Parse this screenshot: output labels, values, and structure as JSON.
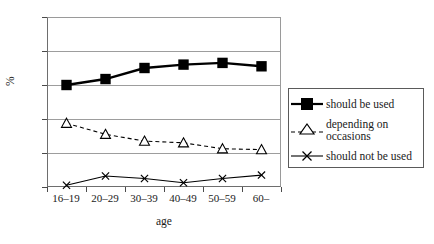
{
  "chart_data": {
    "type": "line",
    "title": "",
    "xlabel": "age",
    "ylabel": "%",
    "categories": [
      "16–19",
      "20–29",
      "30–39",
      "40–49",
      "50–59",
      "60–"
    ],
    "ylim": [
      0,
      100
    ],
    "yticks": [
      0,
      20,
      40,
      60,
      80,
      100
    ],
    "grid": true,
    "legend_position": "right",
    "series": [
      {
        "name": "should be used",
        "values": [
          60,
          63.5,
          70,
          72,
          73,
          71
        ],
        "marker": "filled-square",
        "linestyle": "solid",
        "color": "#000000"
      },
      {
        "name": "depending on occasions",
        "values": [
          37.5,
          31,
          27,
          26,
          22.5,
          22
        ],
        "marker": "open-triangle",
        "linestyle": "dashed",
        "color": "#000000"
      },
      {
        "name": "should not be used",
        "values": [
          1,
          6.5,
          5,
          2.5,
          5,
          7
        ],
        "marker": "x",
        "linestyle": "solid",
        "color": "#000000"
      }
    ]
  },
  "axes": {
    "ytick_labels": [
      "100",
      "80",
      "60",
      "40",
      "20",
      "0"
    ],
    "ylabel_text": "%",
    "xlabel_text": "age",
    "xtick_labels": [
      "16–19",
      "20–29",
      "30–39",
      "40–49",
      "50–59",
      "60–"
    ]
  },
  "legend": {
    "items": [
      {
        "label": "should be used",
        "marker": "filled-square",
        "linestyle": "solid"
      },
      {
        "label": "depending on occasions",
        "marker": "open-triangle",
        "linestyle": "dashed"
      },
      {
        "label": "should not be used",
        "marker": "x",
        "linestyle": "solid"
      }
    ]
  },
  "colors": {
    "ink": "#000000",
    "grid": "#9d9d9d",
    "frame": "#6e6e6e",
    "background": "#ffffff"
  }
}
